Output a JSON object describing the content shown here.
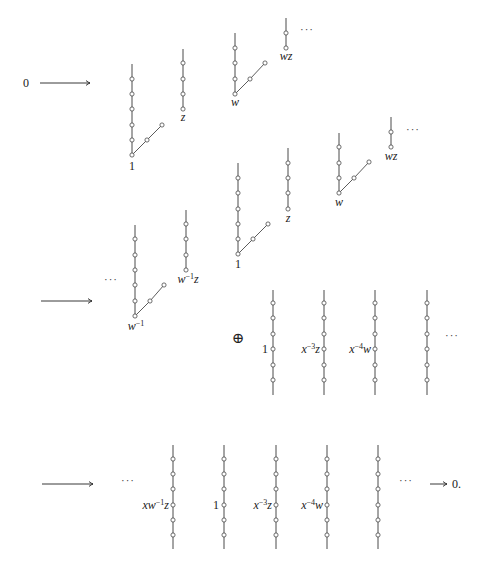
{
  "figure": {
    "colors": {
      "line": "#4a4a4a",
      "node_fill": "#ffffff",
      "text": "#1a1a1a"
    },
    "node_radius": 2.1
  },
  "texts": [
    {
      "name": "zero-start",
      "x": 26,
      "y": 87,
      "anchor": "middle",
      "parts": [
        {
          "t": "0"
        }
      ]
    },
    {
      "name": "row2-ellipsis-left",
      "x": 111,
      "y": 283,
      "anchor": "middle",
      "kind": "dots",
      "parts": [
        {
          "t": "···"
        }
      ]
    },
    {
      "name": "oplus-sign",
      "x": 238,
      "y": 343,
      "anchor": "middle",
      "kind": "oplus",
      "parts": [
        {
          "t": "⊕"
        }
      ]
    },
    {
      "name": "row2-ellipsis-right",
      "x": 452,
      "y": 339,
      "anchor": "middle",
      "kind": "dots",
      "parts": [
        {
          "t": "···"
        }
      ]
    },
    {
      "name": "row3-ellipsis-left",
      "x": 128,
      "y": 484,
      "anchor": "middle",
      "kind": "dots",
      "parts": [
        {
          "t": "···"
        }
      ]
    },
    {
      "name": "row3-ellipsis-right",
      "x": 406,
      "y": 484,
      "anchor": "middle",
      "kind": "dots",
      "parts": [
        {
          "t": "···"
        }
      ]
    },
    {
      "name": "zero-end",
      "x": 452,
      "y": 488,
      "anchor": "start",
      "parts": [
        {
          "t": "0."
        }
      ]
    },
    {
      "name": "row1a-ellipsis",
      "x": 307,
      "y": 33,
      "anchor": "middle",
      "kind": "dots",
      "parts": [
        {
          "t": "···"
        }
      ]
    },
    {
      "name": "row1b-ellipsis",
      "x": 413,
      "y": 133,
      "anchor": "middle",
      "kind": "dots",
      "parts": [
        {
          "t": "···"
        }
      ]
    }
  ],
  "arrows": [
    {
      "name": "arrow-0-to-first",
      "x1": 40,
      "y1": 83,
      "x2": 90,
      "y2": 83
    },
    {
      "name": "arrow-first-to-middle",
      "x1": 41,
      "y1": 301,
      "x2": 92,
      "y2": 301
    },
    {
      "name": "arrow-middle-to-last",
      "x1": 42,
      "y1": 484,
      "x2": 93,
      "y2": 484
    },
    {
      "name": "arrow-last-to-0",
      "x1": 430,
      "y1": 484,
      "x2": 447,
      "y2": 484
    }
  ],
  "trees": [
    {
      "name": "tree-1-row1",
      "x": 132,
      "top": 64,
      "bottom": 155,
      "nodes": [
        79,
        94,
        109,
        125,
        140,
        155
      ],
      "diagonal": [
        [
          132,
          155
        ],
        [
          147,
          140
        ],
        [
          162,
          125
        ]
      ],
      "label": {
        "x": 132,
        "y": 170,
        "anchor": "middle",
        "parts": [
          {
            "t": "1"
          }
        ]
      }
    },
    {
      "name": "tree-z-row1",
      "x": 183,
      "top": 49,
      "bottom": 109,
      "nodes": [
        63,
        79,
        94,
        109
      ],
      "label": {
        "x": 183,
        "y": 121,
        "anchor": "middle",
        "parts": [
          {
            "t": "z",
            "it": true
          }
        ]
      }
    },
    {
      "name": "tree-w-row1",
      "x": 235,
      "top": 33,
      "bottom": 94,
      "nodes": [
        48,
        63,
        79,
        94
      ],
      "diagonal": [
        [
          235,
          94
        ],
        [
          250,
          79
        ],
        [
          265,
          63
        ]
      ],
      "label": {
        "x": 235,
        "y": 106,
        "anchor": "middle",
        "parts": [
          {
            "t": "w",
            "it": true
          }
        ]
      }
    },
    {
      "name": "tree-wz-row1",
      "x": 286,
      "top": 18,
      "bottom": 48,
      "nodes": [
        33,
        48
      ],
      "label": {
        "x": 286,
        "y": 60,
        "anchor": "middle",
        "parts": [
          {
            "t": "wz",
            "it": true
          }
        ]
      }
    },
    {
      "name": "tree-1-row1b",
      "x": 238,
      "top": 163,
      "bottom": 254,
      "nodes": [
        178,
        193,
        209,
        224,
        239,
        254
      ],
      "diagonal": [
        [
          238,
          254
        ],
        [
          253,
          239
        ],
        [
          268,
          224
        ]
      ],
      "label": {
        "x": 238,
        "y": 268,
        "anchor": "middle",
        "parts": [
          {
            "t": "1"
          }
        ]
      }
    },
    {
      "name": "tree-z-row1b",
      "x": 288,
      "top": 148,
      "bottom": 209,
      "nodes": [
        163,
        178,
        193,
        209
      ],
      "label": {
        "x": 288,
        "y": 222,
        "anchor": "middle",
        "parts": [
          {
            "t": "z",
            "it": true
          }
        ]
      }
    },
    {
      "name": "tree-w-row1b",
      "x": 339,
      "top": 133,
      "bottom": 193,
      "nodes": [
        147,
        163,
        178,
        193
      ],
      "diagonal": [
        [
          339,
          193
        ],
        [
          354,
          178
        ],
        [
          369,
          162
        ]
      ],
      "label": {
        "x": 339,
        "y": 206,
        "anchor": "middle",
        "parts": [
          {
            "t": "w",
            "it": true
          }
        ]
      }
    },
    {
      "name": "tree-wz-row1b",
      "x": 391,
      "top": 117,
      "bottom": 147,
      "nodes": [
        132,
        147
      ],
      "label": {
        "x": 391,
        "y": 160,
        "anchor": "middle",
        "parts": [
          {
            "t": "wz",
            "it": true
          }
        ]
      }
    },
    {
      "name": "tree-w-inv-row2",
      "x": 135,
      "top": 225,
      "bottom": 316,
      "nodes": [
        239,
        255,
        270,
        285,
        301,
        316
      ],
      "diagonal": [
        [
          135,
          316
        ],
        [
          150,
          301
        ],
        [
          164,
          285
        ]
      ],
      "label": {
        "x": 136,
        "y": 330,
        "anchor": "middle",
        "parts": [
          {
            "t": "w",
            "it": true
          },
          {
            "t": "−1",
            "sup": true
          }
        ]
      }
    },
    {
      "name": "tree-w-inv-z-row2",
      "x": 186,
      "top": 210,
      "bottom": 270,
      "nodes": [
        224,
        239,
        255,
        270
      ],
      "label": {
        "x": 188,
        "y": 283,
        "anchor": "middle",
        "parts": [
          {
            "t": "w",
            "it": true
          },
          {
            "t": "−1",
            "sup": true
          },
          {
            "t": "z",
            "it": true
          }
        ]
      }
    },
    {
      "name": "column-1-row2",
      "x": 273,
      "top": 290,
      "bottom": 395,
      "nodes": [
        303,
        318,
        334,
        349,
        365,
        380
      ],
      "label": {
        "x": 268,
        "y": 353,
        "anchor": "end",
        "parts": [
          {
            "t": "1"
          }
        ]
      }
    },
    {
      "name": "column-x-3z-row2",
      "x": 324,
      "top": 290,
      "bottom": 395,
      "nodes": [
        303,
        318,
        334,
        349,
        365,
        380
      ],
      "label": {
        "x": 320,
        "y": 353,
        "anchor": "end",
        "parts": [
          {
            "t": "x",
            "it": true
          },
          {
            "t": "−3",
            "sup": true
          },
          {
            "t": "z",
            "it": true
          }
        ]
      }
    },
    {
      "name": "column-x-4w-row2",
      "x": 375,
      "top": 290,
      "bottom": 395,
      "nodes": [
        303,
        318,
        334,
        349,
        365,
        380
      ],
      "label": {
        "x": 371,
        "y": 353,
        "anchor": "end",
        "parts": [
          {
            "t": "x",
            "it": true
          },
          {
            "t": "−4",
            "sup": true
          },
          {
            "t": "w",
            "it": true
          }
        ]
      }
    },
    {
      "name": "column-4-row2",
      "x": 427,
      "top": 290,
      "bottom": 395,
      "nodes": [
        303,
        318,
        334,
        349,
        365,
        380
      ]
    },
    {
      "name": "column-xw-1z-row3",
      "x": 173,
      "top": 445,
      "bottom": 549,
      "nodes": [
        459,
        474,
        489,
        505,
        520,
        535
      ],
      "label": {
        "x": 169,
        "y": 509,
        "anchor": "end",
        "parts": [
          {
            "t": "xw",
            "it": true
          },
          {
            "t": "−1",
            "sup": true
          },
          {
            "t": "z",
            "it": true
          }
        ]
      }
    },
    {
      "name": "column-1-row3",
      "x": 224,
      "top": 445,
      "bottom": 549,
      "nodes": [
        459,
        474,
        489,
        505,
        520,
        535
      ],
      "label": {
        "x": 219,
        "y": 509,
        "anchor": "end",
        "parts": [
          {
            "t": "1"
          }
        ]
      }
    },
    {
      "name": "column-x-3z-row3",
      "x": 276,
      "top": 445,
      "bottom": 549,
      "nodes": [
        459,
        474,
        489,
        505,
        520,
        535
      ],
      "label": {
        "x": 272,
        "y": 509,
        "anchor": "end",
        "parts": [
          {
            "t": "x",
            "it": true
          },
          {
            "t": "−3",
            "sup": true
          },
          {
            "t": "z",
            "it": true
          }
        ]
      }
    },
    {
      "name": "column-x-4w-row3",
      "x": 327,
      "top": 445,
      "bottom": 549,
      "nodes": [
        459,
        474,
        489,
        505,
        520,
        535
      ],
      "label": {
        "x": 323,
        "y": 509,
        "anchor": "end",
        "parts": [
          {
            "t": "x",
            "it": true
          },
          {
            "t": "−4",
            "sup": true
          },
          {
            "t": "w",
            "it": true
          }
        ]
      }
    },
    {
      "name": "column-5-row3",
      "x": 378,
      "top": 445,
      "bottom": 549,
      "nodes": [
        459,
        474,
        489,
        505,
        520,
        535
      ]
    }
  ]
}
